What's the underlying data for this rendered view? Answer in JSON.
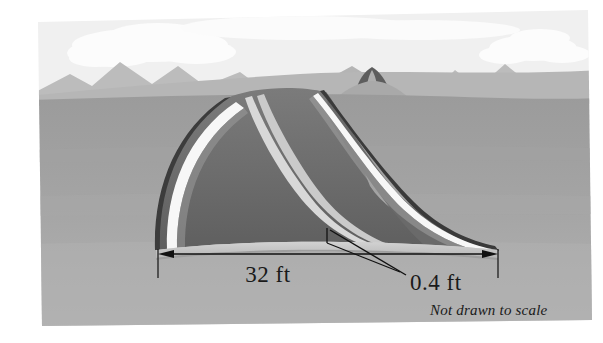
{
  "figure": {
    "kind": "textbook-illustration",
    "alt_description": "A curving two-lane highway crowned in cross-section, drawn over desert hills with mountains and clouds, annotated with its width and slab thickness."
  },
  "labels": {
    "width": "32 ft",
    "thickness": "0.4 ft",
    "note": "Not drawn to scale"
  },
  "measurements": [
    {
      "name": "roadway-width",
      "value": "32 ft",
      "quantity": 32,
      "unit": "ft"
    },
    {
      "name": "slab-thickness",
      "value": "0.4 ft",
      "quantity": 0.4,
      "unit": "ft"
    }
  ],
  "scene": {
    "sky": "#f2f2f2",
    "cloud": "#fbfbfb",
    "mountains_far": "#bdbdbd",
    "mountains_near": "#b2b2b2",
    "hills_light": "#b9b9b9",
    "ground_mid": "#9d9d9d",
    "ground_near": "#a8a8a8",
    "ground_front": "#b0b0b0",
    "road_surface": "#6e6e6e",
    "road_surface_dark": "#646464",
    "road_edge_outline": "#3a3a3a",
    "lane_stripe": "#f5f5f5",
    "center_stripe": "#cfcfcf",
    "slab_top": "#c9c9c9",
    "slab_face": "#b4b4b4",
    "slab_shadow": "#8f8f8f",
    "annotation": "#111111",
    "border_margin": "#ffffff"
  },
  "elements": {
    "sky_label": "sky",
    "cloud_label": "cloud",
    "mountain_label": "mountain-range",
    "ground_label": "desert-ground",
    "road_label": "highway-surface",
    "stripe_label": "lane-stripe",
    "center_label": "center-line",
    "slab_label": "pavement-slab",
    "dimension_label": "dimension-line",
    "leader_label": "leader-line"
  }
}
